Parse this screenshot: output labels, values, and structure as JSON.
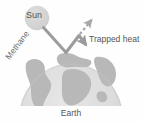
{
  "figure": {
    "width": 142,
    "height": 123,
    "background_color": "#fefefe"
  },
  "labels": {
    "sun": "Sun",
    "trapped_heat": "Trapped heat",
    "methane": "Methane",
    "earth": "Earth"
  },
  "colors": {
    "sun_fill": "#d4d4d4",
    "sun_stroke": "#b4b4b4",
    "ray": "#9a9a9a",
    "escaping_ray": "#a8a8a8",
    "earth_ocean": "#dcdcdc",
    "earth_land": "#b6b6b6",
    "earth_edge": "#cacaca",
    "text": "#555555"
  },
  "elements": {
    "sun_circle": {
      "cx": 37,
      "cy": 18,
      "r": 12
    },
    "incoming_ray": "M 43 27 L 66 52",
    "reflected_ray": "M 66 52 L 79 36",
    "escaping_ray": "M 79 36 L 93 19",
    "trapped_ray": "M 79 36 L 87 47",
    "earth_dome": {
      "cx": 71,
      "cy": 122,
      "rx": 52,
      "ry": 58
    }
  }
}
